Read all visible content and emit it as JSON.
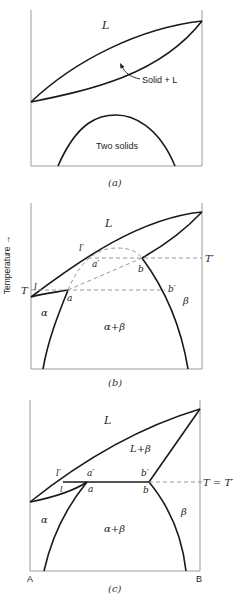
{
  "figure": {
    "y_axis_label": "Temperature →",
    "x_axis_endpoints": [
      "A",
      "B"
    ],
    "panels": [
      {
        "id": "a",
        "caption": "(a)",
        "labels": {
          "liquid": "L",
          "two_phase": "Solid + L",
          "miscibility_gap": "Two solids"
        }
      },
      {
        "id": "b",
        "caption": "(b)",
        "labels": {
          "liquid": "L",
          "alpha": "α",
          "beta": "β",
          "alpha_beta": "α+β",
          "T": "T",
          "T_prime": "T′",
          "l": "l",
          "l_prime": "l′",
          "a": "a",
          "a_prime": "a′",
          "b": "b",
          "b_prime": "b′"
        }
      },
      {
        "id": "c",
        "caption": "(c)",
        "labels": {
          "liquid": "L",
          "liquid_beta": "L+β",
          "alpha": "α",
          "beta": "β",
          "alpha_beta": "α+β",
          "T_eq": "T = T′",
          "l": "l",
          "l_prime": "l′",
          "a": "a",
          "a_prime": "a′",
          "b": "b",
          "b_prime": "b′",
          "A": "A",
          "B": "B"
        }
      }
    ]
  }
}
